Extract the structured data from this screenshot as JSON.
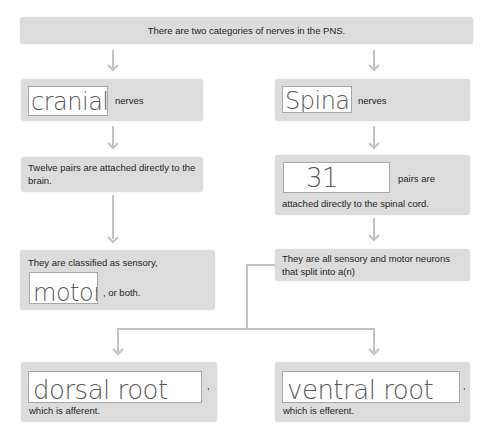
{
  "top": {
    "text": "There are two categories of nerves in the PNS."
  },
  "left": {
    "category_blank": "cranial",
    "category_suffix": "nerves",
    "pairs_text": "Twelve pairs are attached directly to the brain.",
    "classified_prefix": "They are classified as sensory,",
    "classified_blank": "motor",
    "classified_suffix": ", or both."
  },
  "right": {
    "category_blank": "Spinal",
    "category_suffix": "nerves",
    "pairs_blank": "31",
    "pairs_suffix": "pairs are",
    "pairs_line2": "attached directly to the spinal cord.",
    "split_text": "They are all sensory and motor neurons that split into a(n)"
  },
  "bottom_left": {
    "blank": "dorsal root",
    "comma": ",",
    "suffix": "which is afferent."
  },
  "bottom_right": {
    "blank": "ventral root",
    "comma": ",",
    "suffix": "which is efferent."
  },
  "colors": {
    "box_fill": "#dcdcdc",
    "connector": "#c2c2c2",
    "blank_fill": "#ffffff",
    "handwriting": "#5a5a5a"
  }
}
